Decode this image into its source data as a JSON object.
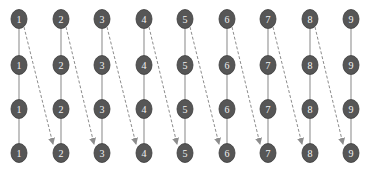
{
  "diagram": {
    "type": "grid-graph",
    "columns": 9,
    "rows": 4,
    "column_labels": [
      "1",
      "2",
      "3",
      "4",
      "5",
      "6",
      "7",
      "8",
      "9"
    ],
    "column_x": [
      19,
      61,
      102,
      144,
      185,
      227,
      268,
      310,
      351
    ],
    "row_y": [
      19,
      65,
      109,
      153
    ],
    "node_rx": 8,
    "node_ry": 9.5,
    "colors": {
      "node_fill": "#565656",
      "node_stroke": "#3a3a3a",
      "node_text": "#f2f2f2",
      "vertical_edge": "#9a9a9a",
      "dashed_arrow": "#8c8c8c"
    },
    "vertical_edges": "solid line connecting consecutive rows within each column",
    "dashed_arrows": [
      {
        "from": {
          "col": "1",
          "row": 1
        },
        "to": {
          "col": "2",
          "row": 4
        }
      },
      {
        "from": {
          "col": "2",
          "row": 1
        },
        "to": {
          "col": "3",
          "row": 4
        }
      },
      {
        "from": {
          "col": "3",
          "row": 1
        },
        "to": {
          "col": "4",
          "row": 4
        }
      },
      {
        "from": {
          "col": "4",
          "row": 1
        },
        "to": {
          "col": "5",
          "row": 4
        }
      },
      {
        "from": {
          "col": "5",
          "row": 1
        },
        "to": {
          "col": "6",
          "row": 4
        }
      },
      {
        "from": {
          "col": "6",
          "row": 1
        },
        "to": {
          "col": "7",
          "row": 4
        }
      },
      {
        "from": {
          "col": "7",
          "row": 1
        },
        "to": {
          "col": "8",
          "row": 4
        }
      },
      {
        "from": {
          "col": "8",
          "row": 1
        },
        "to": {
          "col": "9",
          "row": 4
        }
      }
    ]
  }
}
